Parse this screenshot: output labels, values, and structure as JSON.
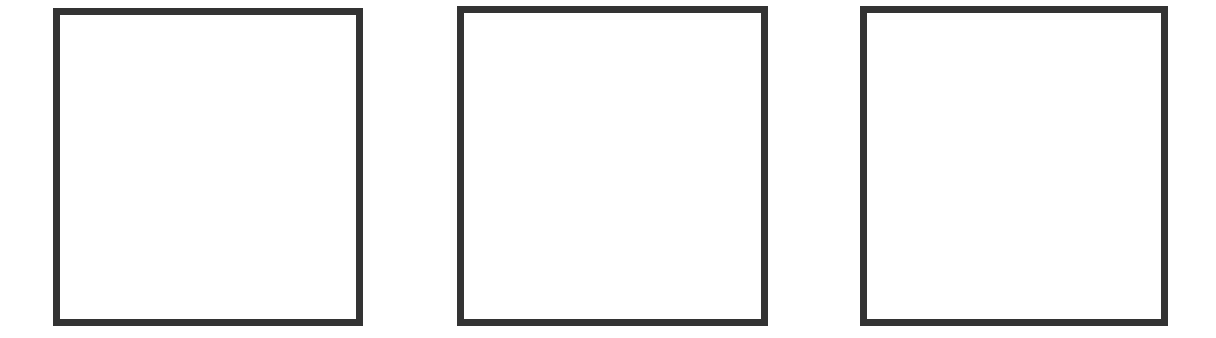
{
  "canvas": {
    "width": 1216,
    "height": 338,
    "background": "#ffffff"
  },
  "style": {
    "border_color": "#333333",
    "border_width": 7
  },
  "panels": [
    {
      "id": "panel-1",
      "x": 53,
      "y": 8,
      "width": 310,
      "height": 318,
      "content": ""
    },
    {
      "id": "panel-2",
      "x": 457,
      "y": 6,
      "width": 311,
      "height": 320,
      "content": ""
    },
    {
      "id": "panel-3",
      "x": 860,
      "y": 6,
      "width": 308,
      "height": 320,
      "content": ""
    }
  ]
}
